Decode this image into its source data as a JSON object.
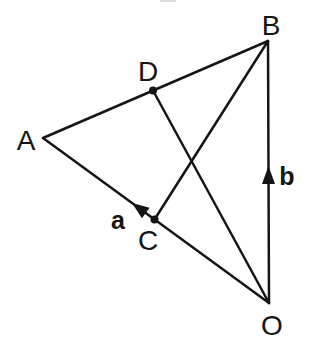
{
  "figure": {
    "type": "vector-geometry-diagram",
    "background": "#ffffff",
    "stroke_color": "#151515",
    "points": [
      {
        "id": "A",
        "label": "A",
        "marked": false
      },
      {
        "id": "B",
        "label": "B",
        "marked": false
      },
      {
        "id": "C",
        "label": "C",
        "marked": true
      },
      {
        "id": "D",
        "label": "D",
        "marked": true
      },
      {
        "id": "O",
        "label": "O",
        "marked": false
      }
    ],
    "segments": [
      {
        "from": "A",
        "to": "B"
      },
      {
        "from": "A",
        "to": "O"
      },
      {
        "from": "B",
        "to": "O"
      },
      {
        "from": "B",
        "to": "C"
      },
      {
        "from": "D",
        "to": "O"
      }
    ],
    "vectors": [
      {
        "label": "a",
        "on_segment": "OA",
        "points_toward": "A"
      },
      {
        "label": "b",
        "on_segment": "OB",
        "points_toward": "B"
      }
    ]
  }
}
